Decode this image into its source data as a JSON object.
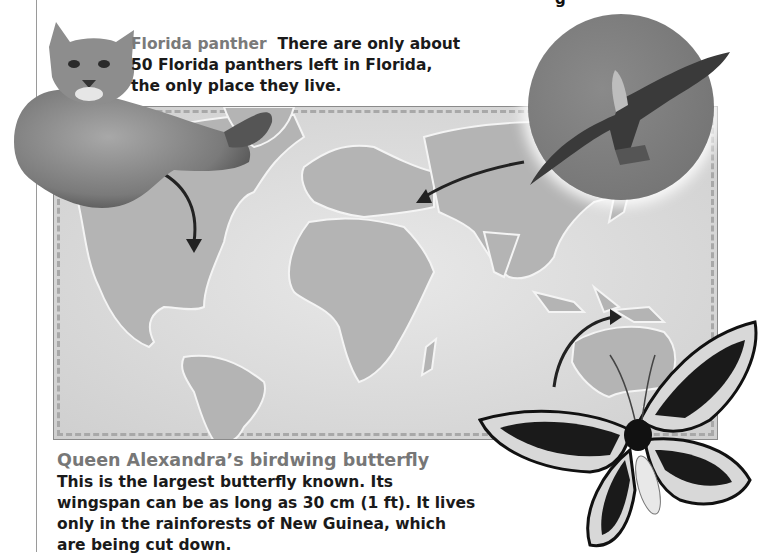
{
  "page": {
    "top_fragment": "g"
  },
  "panther": {
    "heading": "Florida panther",
    "body": "There are only about 50 Florida panthers left in Florida, the only place they live.",
    "image_label": "Florida panther photo"
  },
  "bird": {
    "image_label": "Bird of prey in flight photo"
  },
  "butterfly": {
    "heading": "Queen Alexandra’s birdwing butterfly",
    "body": "This is the largest butterfly known. Its wingspan can be as long as 30 cm (1 ft). It lives only in the rainforests of New Guinea, which are being cut down.",
    "image_label": "Queen Alexandra's birdwing butterfly photo"
  },
  "map": {
    "label": "World map",
    "arrows": [
      {
        "from": "panther",
        "to": "Florida"
      },
      {
        "from": "bird",
        "to": "Eastern Europe"
      },
      {
        "from": "butterfly",
        "to": "New Guinea"
      }
    ]
  },
  "colors": {
    "heading": "#777777",
    "body_text": "#1a1a1a",
    "land": "#b4b4b4",
    "ocean": "#dddddd",
    "rule": "#9a9a9a"
  }
}
